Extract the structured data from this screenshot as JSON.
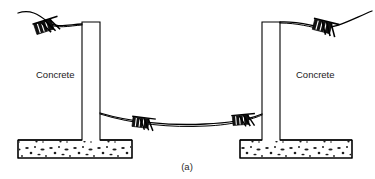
{
  "figure": {
    "caption": "(a)",
    "labels": {
      "left_material": "Concrete",
      "right_material": "Concrete"
    },
    "colors": {
      "line": "#000000",
      "fill": "#ffffff",
      "aggregate": "#111111",
      "text": "#1a1a1a",
      "background": "#ffffff"
    },
    "elements": [
      {
        "name": "left-concrete-wall",
        "type": "inverted-t-footing",
        "stem": {
          "x": 82,
          "y": 22,
          "width": 18,
          "height": 118
        },
        "footing": {
          "x": 18,
          "y": 140,
          "width": 114,
          "height": 18
        }
      },
      {
        "name": "right-concrete-wall",
        "type": "inverted-t-footing",
        "stem": {
          "x": 262,
          "y": 22,
          "width": 18,
          "height": 118
        },
        "footing": {
          "x": 240,
          "y": 140,
          "width": 112,
          "height": 18
        }
      },
      {
        "name": "left-top-cable",
        "type": "cable",
        "description": "cable draped over top of left wall running off to upper left"
      },
      {
        "name": "right-top-cable",
        "type": "cable",
        "description": "cable draped over top of right wall running off to upper right"
      },
      {
        "name": "span-cable",
        "type": "cable",
        "description": "sagging cable spanning between the two walls"
      }
    ],
    "clamps": [
      {
        "name": "left-top-clamp",
        "x": 46,
        "y": 25,
        "angle": -18
      },
      {
        "name": "right-top-clamp",
        "x": 325,
        "y": 25,
        "angle": 14
      },
      {
        "name": "span-left-clamp",
        "x": 143,
        "y": 122,
        "angle": 7
      },
      {
        "name": "span-right-clamp",
        "x": 243,
        "y": 119,
        "angle": -5
      }
    ]
  }
}
